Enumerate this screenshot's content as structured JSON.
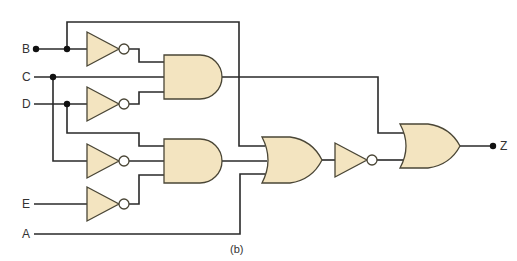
{
  "diagram": {
    "type": "logic-circuit",
    "caption": "(b)",
    "inputs": [
      {
        "id": "B",
        "label": "B"
      },
      {
        "id": "C",
        "label": "C"
      },
      {
        "id": "D",
        "label": "D"
      },
      {
        "id": "E",
        "label": "E"
      },
      {
        "id": "A",
        "label": "A"
      }
    ],
    "output": {
      "id": "Z",
      "label": "Z"
    },
    "gates": [
      {
        "id": "not1",
        "type": "NOT",
        "input": "B"
      },
      {
        "id": "not2",
        "type": "NOT",
        "input": "D"
      },
      {
        "id": "not3",
        "type": "NOT",
        "input": "C"
      },
      {
        "id": "not4",
        "type": "NOT",
        "input": "E"
      },
      {
        "id": "and1",
        "type": "AND",
        "inputs": [
          "not1",
          "C",
          "not2"
        ]
      },
      {
        "id": "and2",
        "type": "AND",
        "inputs": [
          "D",
          "not3",
          "not4"
        ]
      },
      {
        "id": "or1",
        "type": "OR",
        "inputs": [
          "B",
          "and2",
          "A"
        ]
      },
      {
        "id": "not5",
        "type": "NOT",
        "input": "or1"
      },
      {
        "id": "or2",
        "type": "OR",
        "inputs": [
          "and1",
          "not5"
        ]
      }
    ],
    "colors": {
      "gate_fill": "#F3E4C0",
      "gate_stroke": "#4a4636",
      "wire": "#2a2a2a"
    }
  }
}
